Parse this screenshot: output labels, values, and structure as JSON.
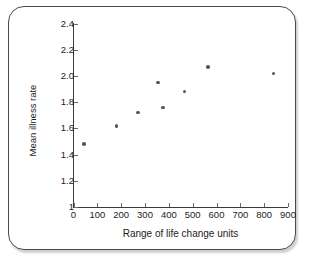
{
  "chart_data": {
    "type": "scatter",
    "title": "",
    "xlabel": "Range of life change units",
    "ylabel": "Mean illness rate",
    "xlim": [
      0,
      900
    ],
    "ylim": [
      1,
      2.4
    ],
    "xticks": [
      0,
      100,
      200,
      300,
      400,
      500,
      600,
      700,
      800,
      900
    ],
    "xtick_labels": [
      "0",
      "100",
      "200",
      "300",
      "400",
      "500",
      "600",
      "700",
      "800",
      "900"
    ],
    "yticks": [
      1,
      1.2,
      1.4,
      1.6,
      1.8,
      2.0,
      2.2,
      2.4
    ],
    "ytick_labels": [
      "1",
      "1.2",
      "1.4",
      "1.6",
      "1.8",
      "2.0",
      "2.2",
      "2.4"
    ],
    "grid": false,
    "legend": null,
    "marker_color": "#57575c",
    "axis_color": "#3d3d3d",
    "points": [
      {
        "x": 45,
        "y": 1.48
      },
      {
        "x": 180,
        "y": 1.62
      },
      {
        "x": 270,
        "y": 1.72
      },
      {
        "x": 355,
        "y": 1.95
      },
      {
        "x": 375,
        "y": 1.76
      },
      {
        "x": 465,
        "y": 1.88
      },
      {
        "x": 565,
        "y": 2.07
      },
      {
        "x": 840,
        "y": 2.02
      }
    ]
  },
  "frame": {
    "border_color": "#4a4a4a"
  }
}
